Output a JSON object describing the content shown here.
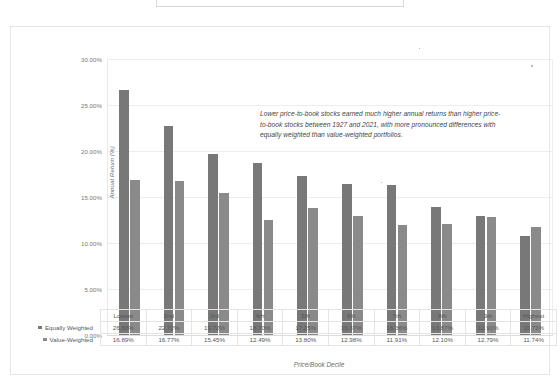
{
  "title_box": {
    "text": ""
  },
  "annotation": {
    "text": "Lower price-to-book stocks earned much higher annual returns than higher price-to-book stocks between 1927 and 2021, with more pronounced differences with equally weighted than value-weighted portfolios."
  },
  "axes": {
    "ylabel": "Annual Return (%)",
    "xlabel": "Price/Book Decile",
    "yticks": [
      "0.00%",
      "5.00%",
      "10.00%",
      "15.00%",
      "20.00%",
      "25.00%",
      "30.00%"
    ]
  },
  "legend": {
    "equally_weighted": "Equally Weighted",
    "value_weighted": "Value-Weighted"
  },
  "colors": {
    "equally_weighted": "#787878",
    "value_weighted": "#8a8a8a",
    "gridline": "#ededed",
    "frame": "#e6e6e6"
  },
  "chart_data": {
    "type": "bar",
    "title": "",
    "xlabel": "Price/Book Decile",
    "ylabel": "Annual Return (%)",
    "ylim": [
      0,
      30
    ],
    "ytick_step": 5,
    "grid": true,
    "legend_position": "table-row-headers",
    "categories": [
      "Lowest",
      "2nd",
      "3rd",
      "4th",
      "5th",
      "6th",
      "7th",
      "8th",
      "9th",
      "Highest"
    ],
    "series": [
      {
        "name": "Equally Weighted",
        "color": "#787878",
        "values": [
          26.68,
          22.72,
          19.72,
          18.7,
          17.25,
          16.37,
          16.36,
          13.87,
          12.91,
          10.71
        ],
        "labels": [
          "26.68%",
          "22.72%",
          "19.72%",
          "18.70%",
          "17.25%",
          "16.37%",
          "16.36%",
          "13.87%",
          "12.91%",
          "10.71%"
        ]
      },
      {
        "name": "Value-Weighted",
        "color": "#8a8a8a",
        "values": [
          16.89,
          16.77,
          15.45,
          12.49,
          13.8,
          12.98,
          11.91,
          12.1,
          12.79,
          11.74
        ],
        "labels": [
          "16.89%",
          "16.77%",
          "15.45%",
          "12.49%",
          "13.80%",
          "12.98%",
          "11.91%",
          "12.10%",
          "12.79%",
          "11.74%"
        ]
      }
    ],
    "annotation": "Lower price-to-book stocks earned much higher annual returns than higher price-to-book stocks between 1927 and 2021, with more pronounced differences with equally weighted than value-weighted portfolios."
  }
}
